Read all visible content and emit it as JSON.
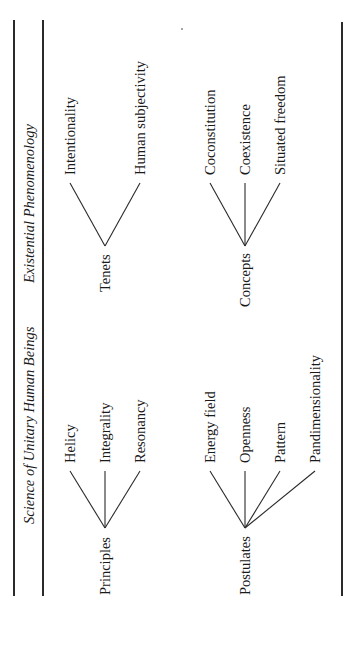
{
  "diagram": {
    "columns": [
      {
        "header": "Existential Phenomenology",
        "groups": [
          {
            "root": "Tenets",
            "children": [
              "Intentionality",
              "Human subjectivity"
            ]
          },
          {
            "root": "Concepts",
            "children": [
              "Coconstitution",
              "Coexistence",
              "Situated freedom"
            ]
          }
        ]
      },
      {
        "header": "Science of Unitary Human Beings",
        "groups": [
          {
            "root": "Principles",
            "children": [
              "Helicy",
              "Integrality",
              "Resonancy"
            ]
          },
          {
            "root": "Postulates",
            "children": [
              "Energy field",
              "Openness",
              "Pattern",
              "Pandimensionality"
            ]
          }
        ]
      }
    ]
  }
}
